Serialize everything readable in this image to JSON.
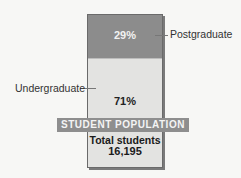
{
  "chart_data": {
    "type": "bar",
    "subtype": "stacked-100",
    "title": "STUDENT POPULATION",
    "categories": [
      "Student population"
    ],
    "series": [
      {
        "name": "Postgraduate",
        "values": [
          29
        ],
        "label": "29%",
        "color": "#8c8c8c"
      },
      {
        "name": "Undergraduate",
        "values": [
          71
        ],
        "label": "71%",
        "color": "#e3e3e1"
      }
    ],
    "total_label": "Total students",
    "total_value": 16195,
    "total_value_text": "16,195",
    "xlabel": "",
    "ylabel": "",
    "ylim": [
      0,
      100
    ],
    "grid": false,
    "legend": "direct labels with leader lines"
  },
  "labels": {
    "postgraduate": "Postgraduate",
    "undergraduate": "Undergraduate",
    "postgraduate_pct": "29%",
    "undergraduate_pct": "71%",
    "banner": "STUDENT POPULATION",
    "total_label": "Total students",
    "total_value": "16,195"
  }
}
